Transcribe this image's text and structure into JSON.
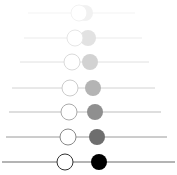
{
  "diagram": {
    "type": "circle-pair-sequence",
    "background": "#ffffff",
    "rows": [
      {
        "y": 13,
        "line_x1": 28,
        "line_x2": 135,
        "line_color": "#f2f2f2",
        "line_width": 1,
        "white_cx": 79,
        "filled_cx": 85,
        "r": 8,
        "outline_color": "#f0f0f0",
        "fill_color": "#f0f0f0",
        "opacity": 0.9
      },
      {
        "y": 38,
        "line_x1": 24,
        "line_x2": 142,
        "line_color": "#ebebeb",
        "line_width": 1,
        "white_cx": 75,
        "filled_cx": 88,
        "r": 8,
        "outline_color": "#e6e6e6",
        "fill_color": "#e2e2e2",
        "opacity": 1
      },
      {
        "y": 62,
        "line_x1": 20,
        "line_x2": 149,
        "line_color": "#e0e0e0",
        "line_width": 1,
        "white_cx": 72,
        "filled_cx": 90,
        "r": 8,
        "outline_color": "#dadada",
        "fill_color": "#d2d2d2",
        "opacity": 1
      },
      {
        "y": 88,
        "line_x1": 12,
        "line_x2": 155,
        "line_color": "#d2d2d2",
        "line_width": 1,
        "white_cx": 70,
        "filled_cx": 93,
        "r": 8,
        "outline_color": "#cccccc",
        "fill_color": "#b4b4b4",
        "opacity": 1
      },
      {
        "y": 112,
        "line_x1": 9,
        "line_x2": 161,
        "line_color": "#bdbdbd",
        "line_width": 1,
        "white_cx": 69,
        "filled_cx": 95,
        "r": 8,
        "outline_color": "#aaaaaa",
        "fill_color": "#8f8f8f",
        "opacity": 1
      },
      {
        "y": 137,
        "line_x1": 6,
        "line_x2": 167,
        "line_color": "#9a9a9a",
        "line_width": 1,
        "white_cx": 68,
        "filled_cx": 97,
        "r": 8,
        "outline_color": "#888888",
        "fill_color": "#6e6e6e",
        "opacity": 1
      },
      {
        "y": 162,
        "line_x1": 2,
        "line_x2": 175,
        "line_color": "#6a6a6a",
        "line_width": 1.2,
        "white_cx": 65,
        "filled_cx": 99,
        "r": 8,
        "outline_color": "#333333",
        "fill_color": "#000000",
        "opacity": 1
      }
    ]
  }
}
